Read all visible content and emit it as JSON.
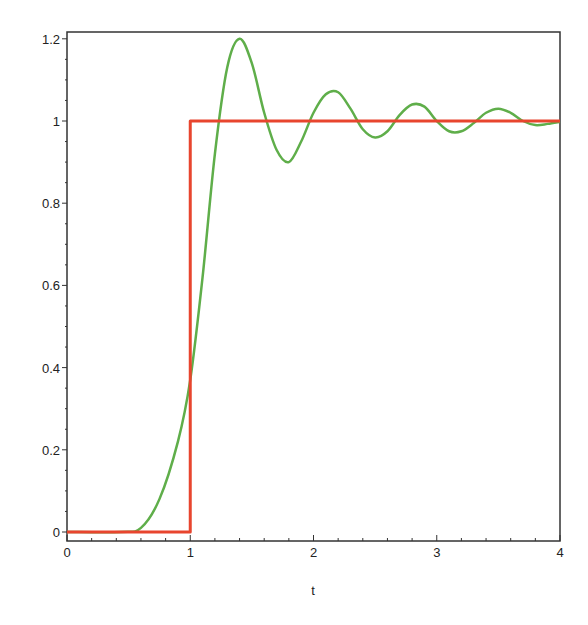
{
  "chart_data": {
    "type": "line",
    "title": "",
    "xlabel": "t",
    "ylabel": "",
    "xlim": [
      0,
      4
    ],
    "ylim": [
      -0.02,
      1.22
    ],
    "grid": false,
    "legend": null,
    "x_ticks": [
      "0",
      "1",
      "2",
      "3",
      "4"
    ],
    "y_ticks": [
      "0",
      "0.2",
      "0.4",
      "0.6",
      "0.8",
      "1",
      "1.2"
    ],
    "series": [
      {
        "name": "step input",
        "color": "#e8452e",
        "x": [
          0,
          1,
          1,
          4
        ],
        "y": [
          0,
          0,
          1,
          1
        ]
      },
      {
        "name": "response",
        "color": "#5fae4a",
        "x": [
          0,
          0.44,
          0.6,
          0.75,
          0.9,
          1.0,
          1.1,
          1.2,
          1.3,
          1.4,
          1.5,
          1.6,
          1.7,
          1.8,
          1.9,
          2.0,
          2.1,
          2.2,
          2.3,
          2.4,
          2.5,
          2.6,
          2.7,
          2.8,
          2.9,
          3.0,
          3.1,
          3.2,
          3.3,
          3.4,
          3.5,
          3.6,
          3.7,
          3.8,
          3.9,
          4.0
        ],
        "y": [
          0,
          0,
          0.01,
          0.08,
          0.22,
          0.37,
          0.62,
          0.92,
          1.13,
          1.2,
          1.14,
          1.02,
          0.93,
          0.9,
          0.95,
          1.02,
          1.065,
          1.07,
          1.03,
          0.98,
          0.96,
          0.975,
          1.015,
          1.04,
          1.035,
          1.0,
          0.975,
          0.975,
          0.995,
          1.02,
          1.03,
          1.02,
          1.0,
          0.99,
          0.993,
          0.998
        ]
      }
    ]
  }
}
